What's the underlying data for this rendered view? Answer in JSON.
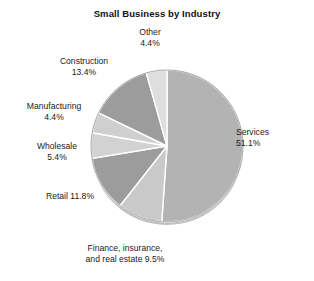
{
  "chart_data": {
    "type": "pie",
    "title": "Small Business by Industry",
    "xlabel": "",
    "ylabel": "",
    "legend_position": "none",
    "grid": false,
    "labels_outside": true,
    "start_angle_deg": 0,
    "direction": "clockwise",
    "categories": [
      "Services",
      "Finance, insurance, and real estate",
      "Retail",
      "Wholesale",
      "Manufacturing",
      "Construction",
      "Other"
    ],
    "values": [
      51.1,
      9.5,
      11.8,
      5.4,
      4.4,
      13.4,
      4.4
    ],
    "units": "percent",
    "slice_colors": [
      "#b3b3b3",
      "#c9c9c9",
      "#9c9c9c",
      "#d2d2d2",
      "#cfcfcf",
      "#9c9c9c",
      "#dedede"
    ],
    "separator_color": "#ffffff",
    "outline_color": "#8f8f8f",
    "shadow_color": "#c0c0c0"
  },
  "labels": {
    "other": {
      "name": "Other",
      "value": "4.4%"
    },
    "construction": {
      "name": "Construction",
      "value": "13.4%"
    },
    "manufacturing": {
      "name": "Manufacturing",
      "value": "4.4%"
    },
    "wholesale": {
      "name": "Wholesale",
      "value": "5.4%"
    },
    "retail": {
      "name": "Retail 11.8%"
    },
    "finance": {
      "line1": "Finance, insurance,",
      "line2": "and real estate 9.5%"
    },
    "services": {
      "name": "Services",
      "value": "51.1%"
    }
  },
  "geometry": {
    "center_x": 167,
    "center_y": 146,
    "radius": 76
  }
}
